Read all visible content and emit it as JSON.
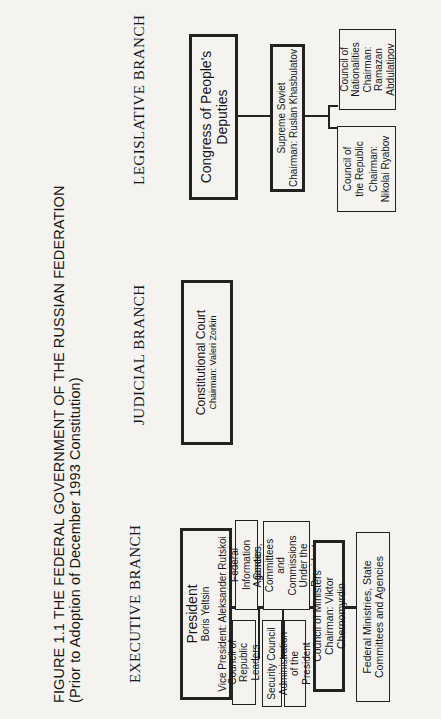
{
  "figure": {
    "title": "FIGURE 1.1    THE FEDERAL GOVERNMENT OF THE RUSSIAN FEDERATION",
    "subtitle": "(Prior to Adoption of December 1993 Constitution)"
  },
  "executive": {
    "heading": "EXECUTIVE  BRANCH",
    "president": {
      "title": "President",
      "name": "Boris Yeltsin",
      "vice": "Vice President: Aleksander Rutskoi"
    },
    "federal_info_center": "Federal Information Center",
    "council_republic_leaders": "Council of Republic Leaders",
    "agencies": {
      "line1": "Agencies, Committees",
      "line2": "and",
      "line3": "Commissions Under the President"
    },
    "security_council": "Security Council",
    "administration": "Administration of the President",
    "council_ministers": {
      "title": "Council of Ministers",
      "chair": "Chairman: Viktor Chernomyrdin"
    },
    "federal_ministries": "Federal Ministries, State Committees and Agencies"
  },
  "judicial": {
    "heading": "JUDICIAL  BRANCH",
    "court": {
      "title": "Constitutional Court",
      "chair": "Chairman: Valeri Zorkin"
    }
  },
  "legislative": {
    "heading": "LEGISLATIVE  BRANCH",
    "congress": "Congress of People's Deputies",
    "supreme_soviet": {
      "title": "Supreme Soviet",
      "chair": "Chairman: Ruslan Khasbulatov"
    },
    "council_republic": {
      "title": "Council of the Republic",
      "chair": "Chairman: Nikolai Ryabov"
    },
    "council_nationalities": {
      "title": "Council of Nationalities",
      "chair": "Chairman: Ramazan Abdulatipov"
    }
  }
}
